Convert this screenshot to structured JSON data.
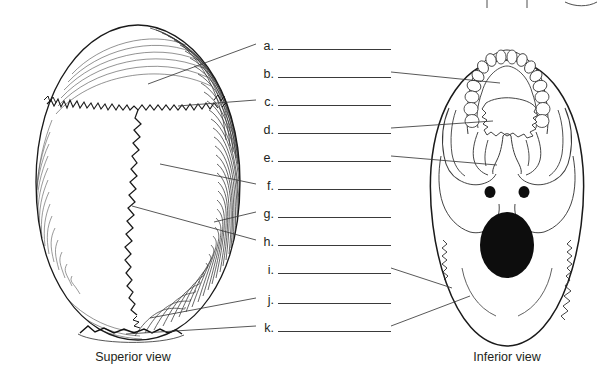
{
  "page": {
    "background_color": "#ffffff",
    "ink_color": "#231f20",
    "line_color": "#3a3a3a",
    "width": 616,
    "height": 380
  },
  "labels": {
    "items": [
      {
        "letter": "a.",
        "x": 258,
        "y": 36,
        "answer": ""
      },
      {
        "letter": "b.",
        "x": 258,
        "y": 64,
        "answer": ""
      },
      {
        "letter": "c.",
        "x": 258,
        "y": 92,
        "answer": ""
      },
      {
        "letter": "d.",
        "x": 258,
        "y": 120,
        "answer": ""
      },
      {
        "letter": "e.",
        "x": 258,
        "y": 148,
        "answer": ""
      },
      {
        "letter": "f.",
        "x": 258,
        "y": 176,
        "answer": ""
      },
      {
        "letter": "g.",
        "x": 258,
        "y": 204,
        "answer": ""
      },
      {
        "letter": "h.",
        "x": 258,
        "y": 232,
        "answer": ""
      },
      {
        "letter": "i.",
        "x": 258,
        "y": 260,
        "answer": ""
      },
      {
        "letter": "j.",
        "x": 258,
        "y": 290,
        "answer": ""
      },
      {
        "letter": "k.",
        "x": 258,
        "y": 318,
        "answer": ""
      }
    ]
  },
  "figures": {
    "left": {
      "caption": "Superior view",
      "caption_x": 133,
      "caption_y": 350
    },
    "right": {
      "caption": "Inferior view",
      "caption_x": 507,
      "caption_y": 350
    }
  },
  "icons": {
    "superior_skull": "skull-superior-view-icon",
    "inferior_skull": "skull-inferior-view-icon",
    "foramen_magnum": "foramen-magnum-icon",
    "carotid_canal_left": "carotid-canal-left-icon",
    "carotid_canal_right": "carotid-canal-right-icon"
  }
}
